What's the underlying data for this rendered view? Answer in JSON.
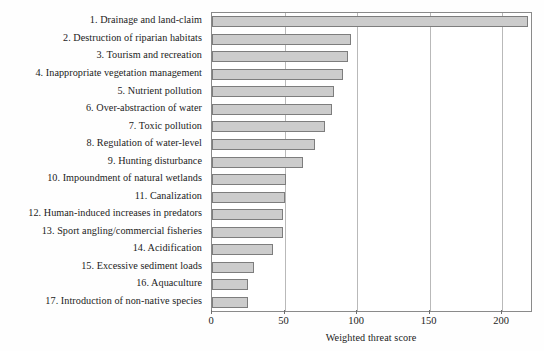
{
  "chart_data": {
    "type": "bar",
    "orientation": "horizontal",
    "title": "",
    "xlabel": "Weighted threat score",
    "ylabel": "",
    "xlim": [
      0,
      220
    ],
    "ylim": null,
    "grid": "vertical gridlines at x ticks",
    "legend": null,
    "xticks": [
      0,
      50,
      100,
      150,
      200
    ],
    "xtick_labels": [
      "0",
      "50",
      "100",
      "150",
      "200"
    ],
    "categories": [
      "1. Drainage and land-claim",
      "2. Destruction of riparian habitats",
      "3. Tourism and recreation",
      "4. Inappropriate vegetation management",
      "5. Nutrient pollution",
      "6. Over-abstraction of water",
      "7. Toxic pollution",
      "8. Regulation of water-level",
      "9. Hunting disturbance",
      "10. Impoundment of natural wetlands",
      "11. Canalization",
      "12. Human-induced increases in predators",
      "13. Sport angling/commercial fisheries",
      "14. Acidification",
      "15. Excessive sediment loads",
      "16. Aquaculture",
      "17. Introduction of non-native species"
    ],
    "values": [
      218,
      96,
      94,
      90,
      84,
      83,
      78,
      71,
      63,
      51,
      50,
      49,
      49,
      42,
      29,
      25,
      25
    ],
    "bar_fill_color": "#cccccc",
    "bar_edge_color": "#7d7d7d",
    "gridline_color": "#b9b9b9",
    "frame_color": "#8a8a8a",
    "background_color": "#ffffff"
  }
}
